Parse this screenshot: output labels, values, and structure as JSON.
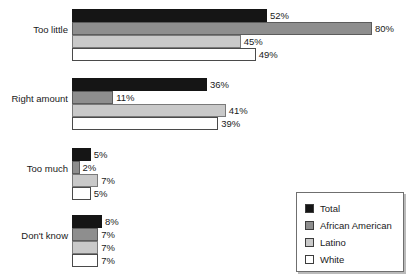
{
  "title_partial": "",
  "chart_data": {
    "type": "bar",
    "orientation": "horizontal",
    "title": "",
    "xlabel": "",
    "ylabel": "",
    "xlim": [
      0,
      80
    ],
    "grid": false,
    "value_suffix": "%",
    "legend_position": "bottom-right",
    "categories": [
      "Too little",
      "Right amount",
      "Too much",
      "Don't know"
    ],
    "series": [
      {
        "name": "Total",
        "color": "#151515",
        "values": [
          52,
          36,
          5,
          8
        ]
      },
      {
        "name": "African American",
        "color": "#8e8e8e",
        "values": [
          80,
          11,
          2,
          7
        ]
      },
      {
        "name": "Latino",
        "color": "#c9c9c9",
        "values": [
          45,
          41,
          7,
          7
        ]
      },
      {
        "name": "White",
        "color": "#ffffff",
        "values": [
          49,
          39,
          5,
          7
        ]
      }
    ],
    "labels": [
      {
        "category": "Too little",
        "series": "Total",
        "text": "52%"
      },
      {
        "category": "Too little",
        "series": "African American",
        "text": "80%"
      },
      {
        "category": "Too little",
        "series": "Latino",
        "text": "45%"
      },
      {
        "category": "Too little",
        "series": "White",
        "text": "49%"
      },
      {
        "category": "Right amount",
        "series": "Total",
        "text": "36%"
      },
      {
        "category": "Right amount",
        "series": "African American",
        "text": "11%"
      },
      {
        "category": "Right amount",
        "series": "Latino",
        "text": "41%"
      },
      {
        "category": "Right amount",
        "series": "White",
        "text": "39%"
      },
      {
        "category": "Too much",
        "series": "Total",
        "text": "5%"
      },
      {
        "category": "Too much",
        "series": "African American",
        "text": "2%"
      },
      {
        "category": "Too much",
        "series": "Latino",
        "text": "7%"
      },
      {
        "category": "Too much",
        "series": "White",
        "text": "5%"
      },
      {
        "category": "Don't know",
        "series": "Total",
        "text": "8%"
      },
      {
        "category": "Don't know",
        "series": "African American",
        "text": "7%"
      },
      {
        "category": "Don't know",
        "series": "Latino",
        "text": "7%"
      },
      {
        "category": "Don't know",
        "series": "White",
        "text": "7%"
      }
    ]
  },
  "legend": {
    "items": [
      {
        "label": "Total"
      },
      {
        "label": "African American"
      },
      {
        "label": "Latino"
      },
      {
        "label": "White"
      }
    ]
  }
}
